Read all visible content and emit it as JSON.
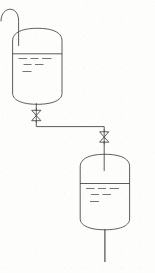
{
  "diagram": {
    "type": "process-flow-diagram",
    "background_color": "#fdfdfc",
    "line_color": "#4a4a4a",
    "canvas": {
      "width": 155,
      "height": 273
    },
    "labels": {
      "inlet_hook": "",
      "upper_tank": "",
      "lower_tank": "",
      "upper_valve": "",
      "lower_valve": "",
      "outlet": ""
    },
    "components": [
      {
        "id": "inlet-hook-pipe",
        "name": "inlet-hook-pipe",
        "kind": "pipe",
        "shape": "hook",
        "path": "M 1 20 C 1 10, 9 7, 15 11 C 18 13, 18.6 17, 18.6 22 L 18.6 45"
      },
      {
        "id": "upper-tank",
        "name": "upper-tank",
        "kind": "vessel",
        "dome_top": true,
        "dished_bottom": true,
        "x": 12.5,
        "y": 30,
        "width": 49.5,
        "height": 74,
        "liquid_level_y": 54,
        "fill_fraction": 0.62
      },
      {
        "id": "upper-tank-liquid-dashes",
        "name": "upper-tank-liquid-marks",
        "kind": "liquid-marks",
        "rows": [
          [
            [
              18.5,
              58.5,
              8.5
            ],
            [
              30.5,
              58.5,
              8.0
            ],
            [
              42.0,
              58.5,
              9.5
            ]
          ],
          [
            [
              23.5,
              64.5,
              8.0
            ],
            [
              35.0,
              64.5,
              8.5
            ]
          ],
          [
            [
              22.5,
              71.5,
              9.0
            ]
          ]
        ]
      },
      {
        "id": "upper-tank-outlet-nozzle",
        "name": "upper-tank-outlet-nozzle",
        "kind": "pipe",
        "path": "M 36.3 104 L 36.3 110"
      },
      {
        "id": "valve-upper",
        "name": "upper-gate-valve",
        "kind": "valve",
        "style": "bowtie-gate",
        "cx": 36.3,
        "cy": 115.5,
        "half_width": 4.6,
        "half_height": 5.2,
        "stem_top": 108.5,
        "stem_bottom": 122.5
      },
      {
        "id": "transfer-line",
        "name": "transfer-line",
        "kind": "pipe",
        "path": "M 36.3 121 L 36.3 126.5 L 104.2 126.5 L 104.2 131"
      },
      {
        "id": "valve-lower",
        "name": "lower-gate-valve",
        "kind": "valve",
        "style": "bowtie-gate",
        "cx": 104.2,
        "cy": 137.0,
        "half_width": 4.6,
        "half_height": 5.2,
        "stem_top": 130.0,
        "stem_bottom": 144.0
      },
      {
        "id": "lower-tank-inlet-dip",
        "name": "lower-tank-inlet-dip-pipe",
        "kind": "pipe",
        "path": "M 104.2 142.5 L 104.2 170"
      },
      {
        "id": "lower-tank",
        "name": "lower-tank",
        "kind": "vessel",
        "dome_top": true,
        "dished_bottom": true,
        "x": 80.0,
        "y": 155,
        "width": 49.5,
        "height": 74,
        "liquid_level_y": 184,
        "fill_fraction": 0.55
      },
      {
        "id": "lower-tank-liquid-dashes",
        "name": "lower-tank-liquid-marks",
        "kind": "liquid-marks",
        "rows": [
          [
            [
              86.0,
              188.5,
              8.5
            ],
            [
              98.0,
              188.5,
              8.0
            ],
            [
              109.5,
              188.5,
              9.5
            ]
          ],
          [
            [
              91.0,
              194.5,
              8.0
            ],
            [
              102.5,
              194.5,
              8.5
            ]
          ],
          [
            [
              90.0,
              201.5,
              9.0
            ]
          ]
        ]
      },
      {
        "id": "outlet-pipe",
        "name": "lower-tank-outlet-pipe",
        "kind": "pipe",
        "path": "M 104.8 229 L 104.8 262"
      }
    ]
  }
}
